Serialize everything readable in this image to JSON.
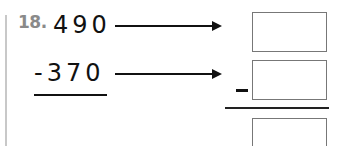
{
  "problem": {
    "number_label": "18.",
    "minuend": "490",
    "subtrahend": "-370",
    "operator": "minus",
    "answer_boxes": [
      {
        "role": "minuend-box",
        "value": ""
      },
      {
        "role": "subtrahend-box",
        "value": ""
      },
      {
        "role": "difference-box",
        "value": ""
      }
    ]
  },
  "colors": {
    "text": "#111111",
    "problem_number": "#8a8a8a",
    "box_border": "#777777",
    "margin_line": "#c8c8c8"
  }
}
